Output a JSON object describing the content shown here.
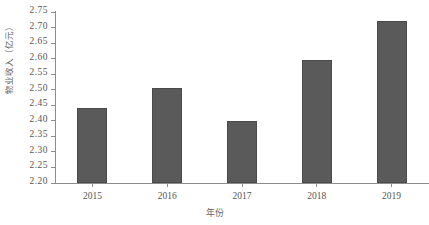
{
  "chart_data": {
    "type": "bar",
    "title": "",
    "subtitle": "",
    "categories": [
      "2015",
      "2016",
      "2017",
      "2018",
      "2019"
    ],
    "values": [
      2.44,
      2.505,
      2.4,
      2.595,
      2.72
    ],
    "xlabel": "年份",
    "ylabel": "物业收入（亿元）",
    "ylim": [
      2.2,
      2.75
    ],
    "ytick_step": 0.05,
    "ytick_labels": [
      "2.75",
      "2.70",
      "2.65",
      "2.60",
      "2.55",
      "2.50",
      "2.45",
      "2.40",
      "2.35",
      "2.30",
      "2.25",
      "2.20"
    ],
    "ytick_values": [
      2.75,
      2.7,
      2.65,
      2.6,
      2.55,
      2.5,
      2.45,
      2.4,
      2.35,
      2.3,
      2.25,
      2.2
    ],
    "grid": false,
    "legend": null,
    "legend_position": "none",
    "series": [
      {
        "name": "物业收入（亿元）",
        "values": [
          2.44,
          2.505,
          2.4,
          2.595,
          2.72
        ]
      }
    ],
    "colors": {
      "bar_fill": "#5a5a5a",
      "bar_border": "#4a4a4a",
      "axis": "#8d8d8d",
      "tick_text": "#555555",
      "label_text": "#666666",
      "background": "#ffffff"
    }
  }
}
